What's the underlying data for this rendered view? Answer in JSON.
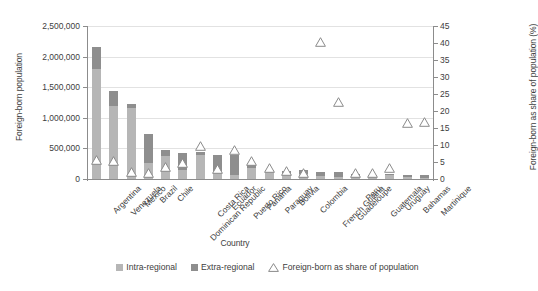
{
  "chart_data": {
    "type": "bar",
    "title": "",
    "xlabel": "Country",
    "ylabel": "Foreign-born population",
    "ylabel_secondary": "Foreign-born as share of population (%)",
    "ylim": [
      0,
      2500000
    ],
    "ylim_secondary": [
      0,
      45
    ],
    "yticks": [
      "0",
      "500,000",
      "1,000,000",
      "1,500,000",
      "2,000,000",
      "2,500,000"
    ],
    "ytick_values": [
      0,
      500000,
      1000000,
      1500000,
      2000000,
      2500000
    ],
    "yticks_secondary": [
      "0",
      "5",
      "10",
      "15",
      "20",
      "25",
      "30",
      "35",
      "40",
      "45"
    ],
    "ytick_values_secondary": [
      0,
      5,
      10,
      15,
      20,
      25,
      30,
      35,
      40,
      45
    ],
    "grid": true,
    "legend_position": "bottom",
    "categories": [
      "Argentina",
      "Venezuela",
      "Mexico",
      "Brazil",
      "Chile",
      "Dominican Republic",
      "Costa Rica",
      "Ecuador",
      "Puerto Rico",
      "Panama",
      "Paraguay",
      "Bolivia",
      "Colombia",
      "French Guiana",
      "Guadeloupe",
      "Peru",
      "Guatemala",
      "Uruguay",
      "Bahamas",
      "Martinique"
    ],
    "series": [
      {
        "name": "Intra-regional",
        "color": "#b6b6b6",
        "values": [
          1790000,
          1195000,
          1155000,
          265000,
          380000,
          140000,
          400000,
          130000,
          60000,
          185000,
          130000,
          100000,
          85000,
          55000,
          25000,
          55000,
          50000,
          65000,
          40000,
          20000
        ]
      },
      {
        "name": "Extra-regional",
        "color": "#8e8e8e",
        "values": [
          375000,
          240000,
          65000,
          470000,
          100000,
          285000,
          35000,
          270000,
          340000,
          45000,
          20000,
          35000,
          65000,
          60000,
          85000,
          25000,
          20000,
          25000,
          25000,
          50000
        ]
      },
      {
        "name": "Foreign-born as share of population",
        "marker": "triangle",
        "axis": "secondary",
        "values": [
          4.3,
          4.2,
          0.9,
          0.5,
          2.3,
          3.5,
          8.6,
          1.9,
          7.5,
          4.0,
          2.0,
          1.1,
          0.6,
          39.0,
          21.5,
          0.5,
          0.5,
          2.0,
          15.3,
          15.6
        ]
      }
    ]
  },
  "legend": {
    "items": [
      {
        "label": "Intra-regional"
      },
      {
        "label": "Extra-regional"
      },
      {
        "label": "Foreign-born as share of population"
      }
    ]
  }
}
